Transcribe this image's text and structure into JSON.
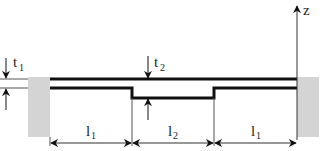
{
  "diagram": {
    "title": "",
    "colors": {
      "wall": "#d4d4d4",
      "line": "#111111",
      "thin_line": "#555555",
      "text": "#222222"
    },
    "axis": {
      "label": "z"
    },
    "thickness_labels": {
      "t1": {
        "base": "t",
        "sub": "1"
      },
      "t2": {
        "base": "t",
        "sub": "2"
      }
    },
    "dimensions": [
      {
        "id": "l1-left",
        "base": "l",
        "sub": "1"
      },
      {
        "id": "l2-middle",
        "base": "l",
        "sub": "2"
      },
      {
        "id": "l1-right",
        "base": "l",
        "sub": "1"
      }
    ],
    "supports": [
      {
        "id": "left-wall",
        "type": "clamped"
      },
      {
        "id": "right-wall",
        "type": "clamped"
      }
    ]
  }
}
